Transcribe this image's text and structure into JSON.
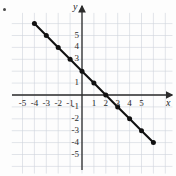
{
  "figure": {
    "background_color": "#fdfdfd",
    "corner_mark": "•"
  },
  "axes": {
    "x_axis_name": "x",
    "y_axis_name": "y",
    "x_ticks": [
      "-5",
      "-4",
      "-3",
      "-2",
      "-1",
      "1",
      "2",
      "3",
      "4",
      "5"
    ],
    "y_ticks": [
      "5",
      "4",
      "3",
      "1",
      "-1",
      "-2",
      "-3",
      "-4",
      "-5"
    ],
    "x_tick_values": [
      -5,
      -4,
      -3,
      -2,
      -1,
      1,
      2,
      3,
      4,
      5
    ],
    "y_tick_values": [
      5,
      4,
      3,
      1,
      -1,
      -2,
      -3,
      -4,
      -5
    ],
    "axis_color": "#2b2b2b",
    "grid_color": "#cfd3db",
    "arrow_x": "right",
    "arrow_y": "up"
  },
  "chart_data": {
    "type": "line",
    "title": "",
    "subtitle": "",
    "xlabel": "x",
    "ylabel": "y",
    "xlim": [
      -6,
      6.6
    ],
    "ylim": [
      -6,
      6.6
    ],
    "grid": true,
    "grid_step": 1,
    "legend": "none",
    "series": [
      {
        "name": "y = -x + 2",
        "color": "#111111",
        "slope": -1,
        "intercept": 2,
        "marker": "filled-circle",
        "x": [
          -4,
          -3,
          -2,
          -1,
          0,
          1,
          2,
          3,
          4,
          5,
          6
        ],
        "y": [
          6,
          5,
          4,
          3,
          2,
          1,
          0,
          -1,
          -2,
          -3,
          -4
        ],
        "points": [
          [
            -4,
            6
          ],
          [
            -3,
            5
          ],
          [
            -2,
            4
          ],
          [
            -1,
            3
          ],
          [
            0,
            2
          ],
          [
            1,
            1
          ],
          [
            2,
            0
          ],
          [
            3,
            -1
          ],
          [
            4,
            -2
          ],
          [
            5,
            -3
          ],
          [
            6,
            -4
          ]
        ],
        "x_intercept": 2,
        "y_intercept": 2
      }
    ],
    "annotations": []
  }
}
